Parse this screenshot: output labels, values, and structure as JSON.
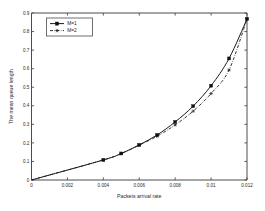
{
  "chart_data": {
    "type": "line",
    "title": "",
    "xlabel": "Packets arrival rate",
    "ylabel": "The mean queue length",
    "xlim": [
      0,
      0.012
    ],
    "ylim": [
      0,
      0.9
    ],
    "grid": false,
    "legend_position": "upper-left",
    "xticks": [
      "0",
      "0.002",
      "0.004",
      "0.006",
      "0.008",
      "0.01",
      "0.012"
    ],
    "xtick_values": [
      0,
      0.002,
      0.004,
      0.006,
      0.008,
      0.01,
      0.012
    ],
    "yticks": [
      "0",
      "0.1",
      "0.2",
      "0.3",
      "0.4",
      "0.5",
      "0.6",
      "0.7",
      "0.8",
      "0.9"
    ],
    "ytick_values": [
      0,
      0.1,
      0.2,
      0.3,
      0.4,
      0.5,
      0.6,
      0.7,
      0.8,
      0.9
    ],
    "x": [
      0,
      0.004,
      0.005,
      0.006,
      0.007,
      0.008,
      0.009,
      0.01,
      0.011,
      0.012
    ],
    "series": [
      {
        "name": "M=1",
        "linestyle": "solid",
        "marker": "square",
        "color": "#1a1a1a",
        "values": [
          0,
          0.108,
          0.143,
          0.189,
          0.243,
          0.313,
          0.398,
          0.508,
          0.655,
          0.868
        ]
      },
      {
        "name": "M=2",
        "linestyle": "dash-dot",
        "marker": "star",
        "color": "#1a1a1a",
        "values": [
          0,
          0.108,
          0.143,
          0.188,
          0.236,
          0.297,
          0.371,
          0.466,
          0.593,
          0.868
        ]
      }
    ]
  },
  "legend": {
    "entries": [
      {
        "label": "M=1"
      },
      {
        "label": "M=2"
      }
    ]
  },
  "axes": {
    "x_title": "Packets arrival rate",
    "y_title": "The mean queue length"
  }
}
